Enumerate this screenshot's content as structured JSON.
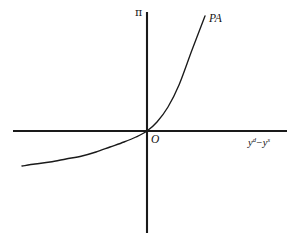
{
  "figure": {
    "background_color": "#ffffff",
    "line_color": "#1a1a1a",
    "width": 299,
    "height": 244,
    "y_axis_label": "π",
    "curve_label": "PA",
    "origin_label": "O",
    "x_axis_label_base_1": "y",
    "x_axis_label_sup_1": "d",
    "x_axis_label_operator": "−",
    "x_axis_label_base_2": "y",
    "x_axis_label_sup_2": "s"
  },
  "chart_data": {
    "type": "line",
    "title": "",
    "subtitle": "",
    "xlabel": "yᵈ − yˢ",
    "ylabel": "π",
    "grid": false,
    "legend": "none",
    "annotations": [
      {
        "text": "PA",
        "x": 0.75,
        "y": 0.96,
        "style": "italic"
      },
      {
        "text": "O",
        "x": 0.03,
        "y": -0.08,
        "style": "italic"
      },
      {
        "text": "π",
        "x": -0.05,
        "y": 1.03,
        "style": "upright"
      }
    ],
    "axis_origin_px": {
      "x": 147,
      "y": 131
    },
    "x_axis_px": {
      "x1": 13,
      "x2": 287,
      "y": 131
    },
    "y_axis_px": {
      "x": 147,
      "y1": 12,
      "y2": 233
    },
    "xlim": [
      -1.0,
      1.1
    ],
    "ylim": [
      -0.55,
      1.3
    ],
    "series": [
      {
        "name": "PA",
        "description": "Phillips curve: inflation rises convexly with the output gap",
        "x": [
          -0.91,
          -0.8,
          -0.7,
          -0.6,
          -0.5,
          -0.4,
          -0.3,
          -0.2,
          -0.1,
          0.0,
          0.1,
          0.2,
          0.3,
          0.4,
          0.45
        ],
        "y": [
          -0.27,
          -0.25,
          -0.23,
          -0.21,
          -0.19,
          -0.16,
          -0.13,
          -0.09,
          -0.05,
          0.0,
          0.08,
          0.2,
          0.39,
          0.7,
          0.9
        ],
        "points_px": [
          {
            "x": 22,
            "y": 166
          },
          {
            "x": 35,
            "y": 164
          },
          {
            "x": 50,
            "y": 162
          },
          {
            "x": 66,
            "y": 159
          },
          {
            "x": 82,
            "y": 156
          },
          {
            "x": 96,
            "y": 152
          },
          {
            "x": 110,
            "y": 147
          },
          {
            "x": 124,
            "y": 142
          },
          {
            "x": 136,
            "y": 137
          },
          {
            "x": 147,
            "y": 131
          },
          {
            "x": 157,
            "y": 122
          },
          {
            "x": 168,
            "y": 107
          },
          {
            "x": 179,
            "y": 85
          },
          {
            "x": 192,
            "y": 50
          },
          {
            "x": 205,
            "y": 16
          }
        ]
      }
    ]
  }
}
